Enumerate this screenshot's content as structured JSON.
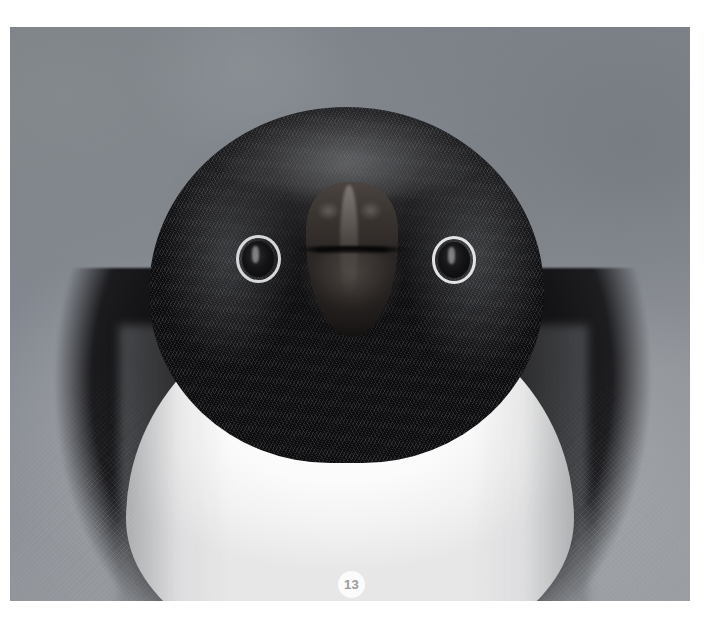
{
  "page": {
    "background_color": "#ffffff",
    "width": 727,
    "height": 637
  },
  "photo": {
    "name": "penguin-portrait-photo",
    "subject": "Adélie penguin head-on close-up portrait",
    "alt_text": "Close-up front-facing portrait of an Adélie penguin with white eye rings, dark head and white chest against a blurred gray background",
    "frame": {
      "left": 10,
      "top": 27,
      "width": 680,
      "height": 574
    },
    "colors": {
      "background_gray_top_left": "#7a7f85",
      "background_gray_bottom": "#9a9ea2",
      "head_dark": "#121214",
      "chest_white": "#ffffff",
      "beak_brown": "#3a3431",
      "eye_ring_white": "#e4e5e7"
    }
  },
  "badge": {
    "name": "image-index-badge",
    "label": "13",
    "text_color": "#9a9a9a",
    "background_color": "#fcfcfc",
    "position": {
      "center_x": 358,
      "center_y": 592,
      "diameter": 27
    }
  }
}
